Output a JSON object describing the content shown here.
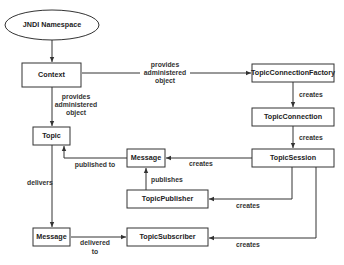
{
  "diagram": {
    "nodes": {
      "jndi_namespace": "JNDI Namespace",
      "context": "Context",
      "topic": "Topic",
      "topic_connection_factory": "TopicConnectionFactory",
      "topic_connection": "TopicConnection",
      "topic_session": "TopicSession",
      "message_published": "Message",
      "topic_publisher": "TopicPublisher",
      "message_delivered": "Message",
      "topic_subscriber": "TopicSubscriber"
    },
    "edge_labels": {
      "context_to_factory": [
        "provides",
        "administered",
        "object"
      ],
      "context_to_topic": [
        "provides",
        "administered",
        "object"
      ],
      "factory_to_connection": "creates",
      "connection_to_session": "creates",
      "session_to_message": "creates",
      "message_to_topic": "published to",
      "publisher_to_message": "publishes",
      "session_to_publisher": "creates",
      "topic_to_message": "delivers",
      "message_to_subscriber": [
        "delivered",
        "to"
      ],
      "session_to_subscriber": "creates"
    }
  }
}
